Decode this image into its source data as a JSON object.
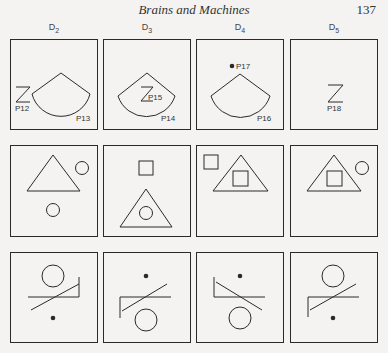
{
  "header": {
    "title": "Brains and Machines",
    "page_number": "137"
  },
  "columns": [
    {
      "label": "D",
      "subscript": "2"
    },
    {
      "label": "D",
      "subscript": "3"
    },
    {
      "label": "D",
      "subscript": "4"
    },
    {
      "label": "D",
      "subscript": "5"
    }
  ],
  "row1_labels": {
    "p12": "P12",
    "p13": "P13",
    "p14": "P14",
    "p15": "P15",
    "p16": "P16",
    "p17": "P17",
    "p18": "P18"
  },
  "colors": {
    "ink": "#2a2a2a",
    "paper": "#f4f3f1"
  }
}
